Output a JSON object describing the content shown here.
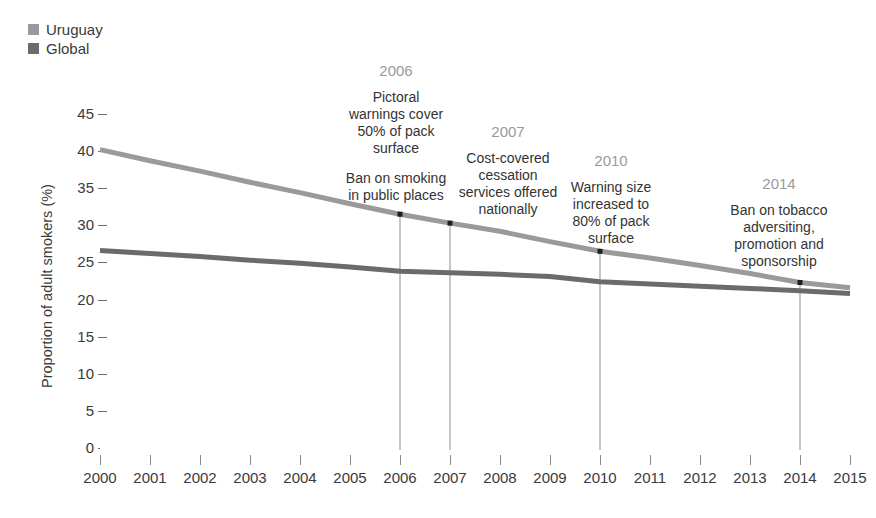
{
  "legend": {
    "position": "top-left",
    "items": [
      {
        "label": "Uruguay",
        "color": "#9a9a9a",
        "icon": "square-swatch-icon"
      },
      {
        "label": "Global",
        "color": "#6b6b6b",
        "icon": "square-swatch-icon"
      }
    ]
  },
  "axes": {
    "y_title": "Proportion of adult smokers (%)",
    "y_ticks": [
      "0",
      "5",
      "10",
      "15",
      "20",
      "25",
      "30",
      "35",
      "40",
      "45"
    ],
    "x_ticks": [
      "2000",
      "2001",
      "2002",
      "2003",
      "2004",
      "2005",
      "2006",
      "2007",
      "2008",
      "2009",
      "2010",
      "2011",
      "2012",
      "2013",
      "2014",
      "2015"
    ]
  },
  "annotations": [
    {
      "year": "2006",
      "paragraphs": [
        "Pictoral\nwarnings cover\n50% of pack\nsurface",
        "Ban on smoking\nin public places"
      ],
      "lines": [
        [
          "Pictoral",
          "warnings cover",
          "50% of pack",
          "surface"
        ],
        [
          "Ban on smoking",
          "in public places"
        ]
      ]
    },
    {
      "year": "2007",
      "paragraphs": [
        "Cost-covered\ncessation\nservices offered\nnationally"
      ],
      "lines": [
        [
          "Cost-covered",
          "cessation",
          "services offered",
          "nationally"
        ]
      ]
    },
    {
      "year": "2010",
      "paragraphs": [
        "Warning size\nincreased to\n80% of pack\nsurface"
      ],
      "lines": [
        [
          "Warning size",
          "increased to",
          "80% of pack",
          "surface"
        ]
      ]
    },
    {
      "year": "2014",
      "paragraphs": [
        "Ban on tobacco\nadversiting,\npromotion and\nsponsorship"
      ],
      "lines": [
        [
          "Ban on tobacco",
          "adversiting,",
          "promotion and",
          "sponsorship"
        ]
      ]
    }
  ],
  "chart_data": {
    "type": "line",
    "title": "",
    "subtitle": "",
    "xlabel": "",
    "ylabel": "Proportion of adult smokers (%)",
    "xlim": [
      2000,
      2015
    ],
    "ylim": [
      0,
      45
    ],
    "grid": false,
    "legend_position": "top-left",
    "x": [
      2000,
      2001,
      2002,
      2003,
      2004,
      2005,
      2006,
      2007,
      2008,
      2009,
      2010,
      2011,
      2012,
      2013,
      2014,
      2015
    ],
    "series": [
      {
        "name": "Uruguay",
        "color": "#9a9a9a",
        "values": [
          40.2,
          38.7,
          37.3,
          35.8,
          34.4,
          32.9,
          31.5,
          30.3,
          29.2,
          27.8,
          26.5,
          25.6,
          24.6,
          23.5,
          22.3,
          21.6
        ]
      },
      {
        "name": "Global",
        "color": "#6b6b6b",
        "values": [
          26.6,
          26.2,
          25.8,
          25.3,
          24.9,
          24.4,
          23.8,
          23.6,
          23.4,
          23.1,
          22.4,
          22.1,
          21.8,
          21.5,
          21.2,
          20.8
        ]
      }
    ],
    "markers": [
      {
        "year": 2006,
        "series": "Uruguay",
        "value": 31.5,
        "label": "2006"
      },
      {
        "year": 2007,
        "series": "Uruguay",
        "value": 30.3,
        "label": "2007"
      },
      {
        "year": 2010,
        "series": "Uruguay",
        "value": 26.5,
        "label": "2010"
      },
      {
        "year": 2014,
        "series": "Uruguay",
        "value": 22.3,
        "label": "2014"
      }
    ]
  }
}
